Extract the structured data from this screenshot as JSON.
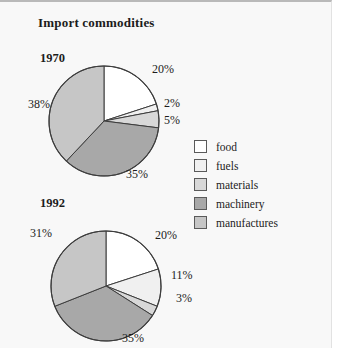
{
  "page": {
    "title": "Import commodities",
    "background": "#f8f8f8"
  },
  "legend": {
    "items": [
      {
        "label": "food",
        "color": "#ffffff",
        "swatch_name": "legend-swatch-food"
      },
      {
        "label": "fuels",
        "color": "#f0f0f0",
        "swatch_name": "legend-swatch-fuels"
      },
      {
        "label": "materials",
        "color": "#d8d8d8",
        "swatch_name": "legend-swatch-materials"
      },
      {
        "label": "machinery",
        "color": "#a8a8a8",
        "swatch_name": "legend-swatch-machinery"
      },
      {
        "label": "manufactures",
        "color": "#c6c6c6",
        "swatch_name": "legend-swatch-manufactures"
      }
    ]
  },
  "charts": [
    {
      "year": "1970",
      "labels": [
        "20%",
        "2%",
        "5%",
        "35%",
        "38%"
      ]
    },
    {
      "year": "1992",
      "labels": [
        "20%",
        "11%",
        "3%",
        "35%",
        "31%"
      ]
    }
  ],
  "chart_data": [
    {
      "type": "pie",
      "title": "1970",
      "categories": [
        "food",
        "fuels",
        "materials",
        "machinery",
        "manufactures"
      ],
      "values": [
        20,
        2,
        5,
        35,
        38
      ],
      "value_labels": [
        "20%",
        "2%",
        "5%",
        "35%",
        "38%"
      ],
      "units": "percent",
      "colors": [
        "#ffffff",
        "#f0f0f0",
        "#d8d8d8",
        "#a8a8a8",
        "#c6c6c6"
      ],
      "start_angle_deg": 0,
      "direction": "clockwise",
      "legend_position": "right",
      "grid": false
    },
    {
      "type": "pie",
      "title": "1992",
      "categories": [
        "food",
        "fuels",
        "materials",
        "machinery",
        "manufactures"
      ],
      "values": [
        20,
        11,
        3,
        35,
        31
      ],
      "value_labels": [
        "20%",
        "11%",
        "3%",
        "35%",
        "31%"
      ],
      "units": "percent",
      "colors": [
        "#ffffff",
        "#f0f0f0",
        "#d8d8d8",
        "#a8a8a8",
        "#c6c6c6"
      ],
      "start_angle_deg": 0,
      "direction": "clockwise",
      "legend_position": "right",
      "grid": false
    }
  ],
  "label_positions": {
    "chart0": [
      {
        "text": "20%",
        "left": 152,
        "top": 62
      },
      {
        "text": "2%",
        "left": 164,
        "top": 96
      },
      {
        "text": "5%",
        "left": 164,
        "top": 113
      },
      {
        "text": "35%",
        "left": 126,
        "top": 167
      },
      {
        "text": "38%",
        "left": 28,
        "top": 97
      }
    ],
    "chart1": [
      {
        "text": "20%",
        "left": 155,
        "top": 228
      },
      {
        "text": "11%",
        "left": 171,
        "top": 268
      },
      {
        "text": "3%",
        "left": 176,
        "top": 291
      },
      {
        "text": "35%",
        "left": 122,
        "top": 331
      },
      {
        "text": "31%",
        "left": 30,
        "top": 226
      }
    ]
  }
}
